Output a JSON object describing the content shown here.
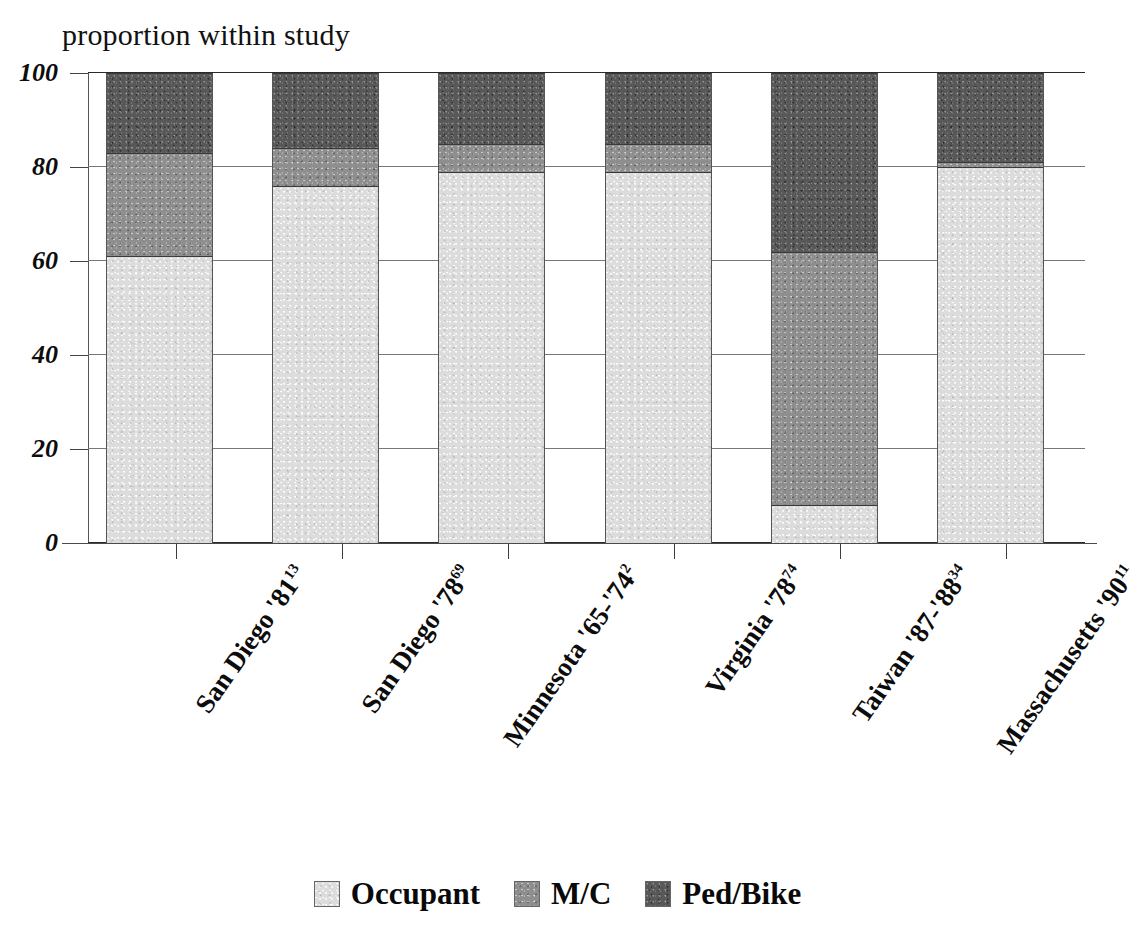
{
  "chart_data": {
    "type": "bar",
    "subtype": "stacked-bar-100",
    "title": "proportion within study",
    "xlabel": "",
    "ylabel": "proportion within study",
    "ylim": [
      0,
      100
    ],
    "yticks": [
      0,
      20,
      40,
      60,
      80,
      100
    ],
    "ytick_labels": [
      "0",
      "20",
      "40",
      "60",
      "80",
      "100"
    ],
    "grid": true,
    "legend_position": "bottom",
    "categories": [
      "San Diego '81",
      "San Diego '78",
      "Minnesota '65-'74",
      "Virginia '78",
      "Taiwan '87-'88",
      "Massachusetts '90"
    ],
    "category_superscripts": [
      "13",
      "69",
      "2",
      "74",
      "34",
      "11"
    ],
    "series": [
      {
        "name": "Occupant",
        "color": "#dcdcdc",
        "values": [
          61,
          76,
          79,
          79,
          8,
          80
        ]
      },
      {
        "name": "M/C",
        "color": "#8e8e8e",
        "values": [
          22,
          8,
          6,
          6,
          54,
          1
        ]
      },
      {
        "name": "Ped/Bike",
        "color": "#585858",
        "values": [
          17,
          16,
          15,
          15,
          38,
          19
        ]
      }
    ]
  },
  "title": {
    "text": "proportion within study"
  },
  "legend": {
    "items": [
      {
        "label": "Occupant",
        "swatch": "legend-swatch-occupant"
      },
      {
        "label": "M/C",
        "swatch": "legend-swatch-mc"
      },
      {
        "label": "Ped/Bike",
        "swatch": "legend-swatch-pedbike"
      }
    ]
  }
}
